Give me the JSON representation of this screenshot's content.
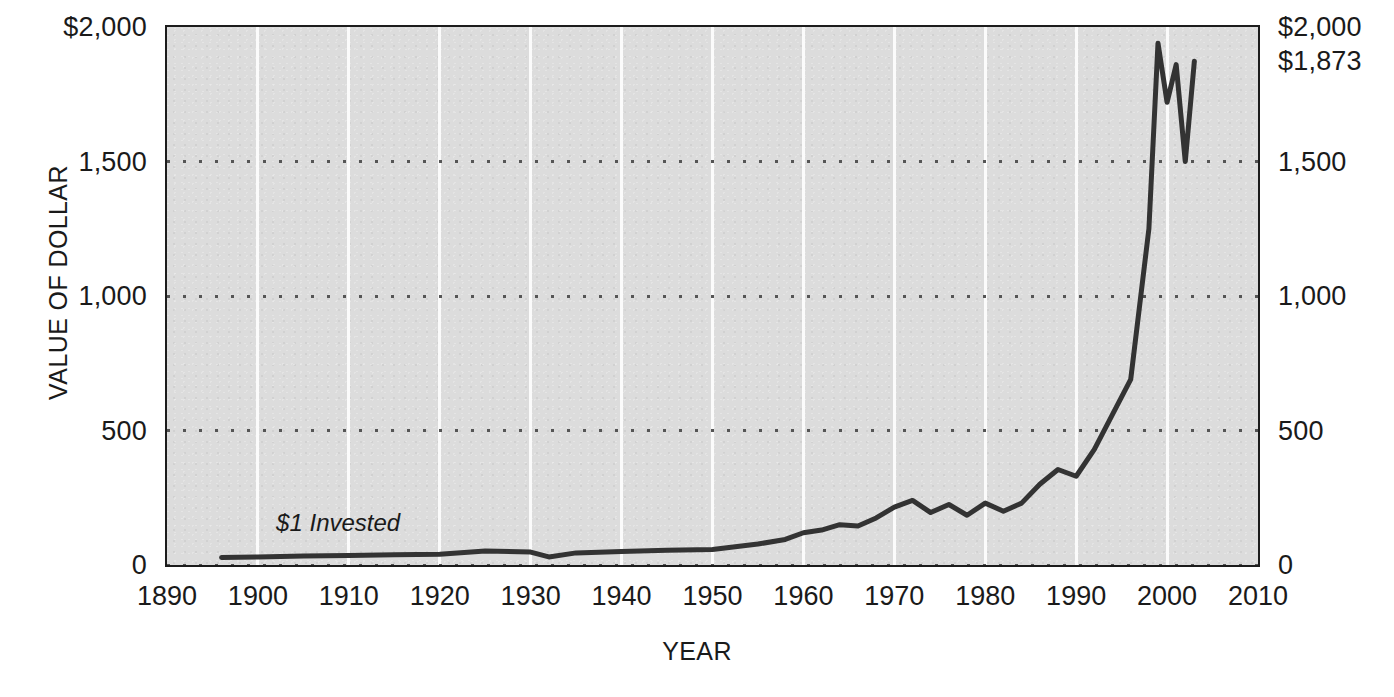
{
  "chart_data": {
    "type": "line",
    "title": "",
    "xlabel": "YEAR",
    "ylabel": "VALUE OF DOLLAR",
    "xlim": [
      1890,
      2010
    ],
    "ylim": [
      0,
      2000
    ],
    "grid": true,
    "legend": null,
    "x_ticks": [
      "1890",
      "1900",
      "1910",
      "1920",
      "1930",
      "1940",
      "1950",
      "1960",
      "1970",
      "1980",
      "1990",
      "2000",
      "2010"
    ],
    "x_tick_values": [
      1890,
      1900,
      1910,
      1920,
      1930,
      1940,
      1950,
      1960,
      1970,
      1980,
      1990,
      2000,
      2010
    ],
    "y_ticks_left": [
      "$2,000",
      "1,500",
      "1,000",
      "500",
      "0"
    ],
    "y_ticks_right": [
      "$2,000",
      "1,500",
      "1,000",
      "500",
      "0"
    ],
    "y_tick_values": [
      2000,
      1500,
      1000,
      500,
      0
    ],
    "extra_right_label": "$1,873",
    "extra_right_label_value": 1873,
    "annotations": [
      {
        "text": "$1 Invested",
        "x": 1902,
        "y": 150
      }
    ],
    "series": [
      {
        "name": "Value of $1 Invested",
        "x": [
          1896,
          1900,
          1905,
          1910,
          1915,
          1920,
          1925,
          1930,
          1932,
          1935,
          1940,
          1945,
          1950,
          1955,
          1958,
          1960,
          1962,
          1964,
          1966,
          1968,
          1970,
          1972,
          1974,
          1976,
          1978,
          1980,
          1982,
          1984,
          1986,
          1988,
          1990,
          1992,
          1994,
          1996,
          1998,
          1999,
          2000,
          2001,
          2002,
          2003
        ],
        "y": [
          28,
          30,
          33,
          35,
          38,
          40,
          52,
          48,
          30,
          45,
          50,
          55,
          58,
          78,
          95,
          120,
          130,
          150,
          145,
          175,
          215,
          240,
          195,
          225,
          185,
          230,
          200,
          230,
          300,
          355,
          330,
          430,
          560,
          690,
          1250,
          1940,
          1720,
          1860,
          1500,
          1873
        ]
      }
    ]
  },
  "axis": {
    "y_title": "VALUE OF DOLLAR",
    "x_title": "YEAR"
  },
  "colors": {
    "plot_background": "#dcdcdc",
    "frame": "#1c1c1c",
    "series_line": "#333333",
    "vgrid": "#fbfbfb",
    "hgrid": "#555555",
    "text": "#1a1a1a"
  }
}
